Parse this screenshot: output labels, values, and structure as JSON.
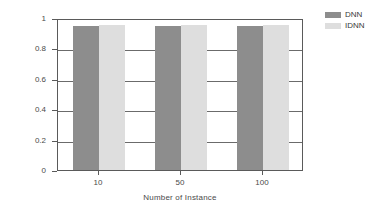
{
  "chart_data": {
    "type": "bar",
    "title": "",
    "subtitle": "",
    "xlabel": "Number of Instance",
    "ylabel": "Precision",
    "categories": [
      "10",
      "50",
      "100"
    ],
    "series": [
      {
        "name": "DNN",
        "color": "#8d8d8d",
        "values": [
          0.95,
          0.95,
          0.945
        ]
      },
      {
        "name": "IDNN",
        "color": "#dedede",
        "values": [
          0.955,
          0.955,
          0.955
        ]
      }
    ],
    "ylim": [
      0,
      1
    ],
    "yticks": [
      "0",
      "0.2",
      "0.4",
      "0.6",
      "0.8",
      "1"
    ],
    "ytick_values": [
      0,
      0.2,
      0.4,
      0.6,
      0.8,
      1
    ],
    "grid": "horizontal",
    "legend_position": "outside-top-right",
    "frame": "box"
  },
  "legend": {
    "entries": [
      {
        "label": "DNN",
        "color": "#8d8d8d"
      },
      {
        "label": "IDNN",
        "color": "#dedede"
      }
    ]
  },
  "colors": {
    "dnn": "#8d8d8d",
    "idnn": "#dedede",
    "axis": "#5a5a5a",
    "grid": "#6b6b6b",
    "text": "#3a3a3a",
    "background": "#ffffff"
  }
}
